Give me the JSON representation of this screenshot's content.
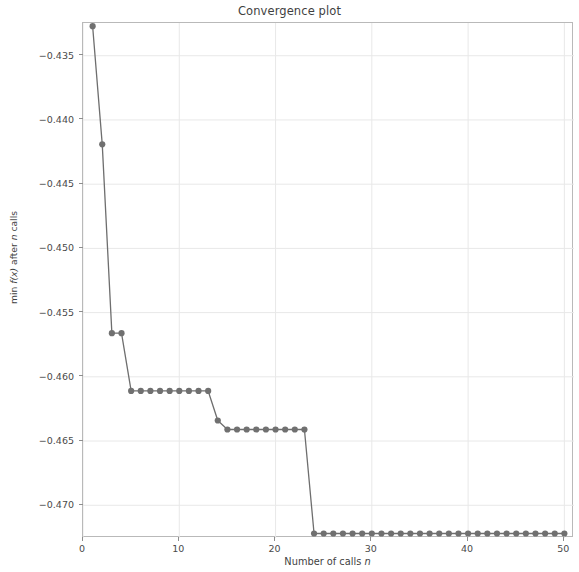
{
  "chart_data": {
    "type": "line",
    "title": "Convergence plot",
    "xlabel": "Number of calls n",
    "xlabel_plain": "Number of calls",
    "xlabel_var": "n",
    "ylabel": "min f(x) after n calls",
    "ylabel_prefix": "min ",
    "ylabel_fn": "f",
    "ylabel_arg": "(x)",
    "ylabel_mid": " after ",
    "ylabel_var": "n",
    "ylabel_suffix": " calls",
    "xlim": [
      0,
      51
    ],
    "ylim": [
      -0.4718,
      -0.4327
    ],
    "xticks": [
      0,
      10,
      20,
      30,
      40,
      50
    ],
    "xtick_labels": [
      "0",
      "10",
      "20",
      "30",
      "40",
      "50"
    ],
    "yticks": [
      -0.435,
      -0.44,
      -0.445,
      -0.45,
      -0.455,
      -0.46,
      -0.465,
      -0.47
    ],
    "ytick_labels": [
      "−0.435",
      "−0.440",
      "−0.445",
      "−0.450",
      "−0.455",
      "−0.460",
      "−0.465",
      "−0.470"
    ],
    "grid": true,
    "legend": null,
    "marker": "circle",
    "line_color": "#6e6e6e",
    "marker_color": "#707070",
    "grid_color": "#e8e8e8",
    "axis_color": "#b9b9b9",
    "x": [
      1,
      2,
      3,
      4,
      5,
      6,
      7,
      8,
      9,
      10,
      11,
      12,
      13,
      14,
      15,
      16,
      17,
      18,
      19,
      20,
      21,
      22,
      23,
      24,
      25,
      26,
      27,
      28,
      29,
      30,
      31,
      32,
      33,
      34,
      35,
      36,
      37,
      38,
      39,
      40,
      41,
      42,
      43,
      44,
      45,
      46,
      47,
      48,
      49,
      50
    ],
    "values": [
      -0.4327,
      -0.4419,
      -0.4566,
      -0.4566,
      -0.4611,
      -0.4611,
      -0.4611,
      -0.4611,
      -0.4611,
      -0.4611,
      -0.4611,
      -0.4611,
      -0.4611,
      -0.4634,
      -0.4641,
      -0.4641,
      -0.4641,
      -0.4641,
      -0.4641,
      -0.4641,
      -0.4641,
      -0.4641,
      -0.4641,
      -0.4722,
      -0.4722,
      -0.4722,
      -0.4722,
      -0.4722,
      -0.4722,
      -0.4722,
      -0.4722,
      -0.4722,
      -0.4722,
      -0.4722,
      -0.4722,
      -0.4722,
      -0.4722,
      -0.4722,
      -0.4722,
      -0.4722,
      -0.4722,
      -0.4722,
      -0.4722,
      -0.4722,
      -0.4722,
      -0.4722,
      -0.4722,
      -0.4722,
      -0.4722,
      -0.4722
    ]
  }
}
